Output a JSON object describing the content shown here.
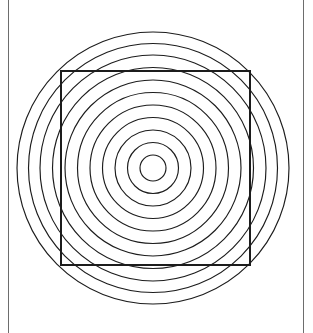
{
  "page": {
    "width": 313,
    "height": 333,
    "background_color": "#ffffff"
  },
  "borders": {
    "color": "#6d6d6d",
    "stroke_width": 1,
    "left_x": 8,
    "right_x": 303,
    "top_y": 0,
    "bottom_y": 333
  },
  "diagram": {
    "stroke_color": "#1c1c1c",
    "fill": "none",
    "center_x": 153,
    "center_y": 168,
    "circle_count": 11,
    "circle_stroke_width": 1.15,
    "radii": [
      13,
      25.5,
      38,
      50.5,
      63,
      75.5,
      88,
      100.5,
      113,
      124.5,
      136
    ],
    "square": {
      "x": 61,
      "y": 71,
      "width": 189,
      "height": 194,
      "stroke_width": 1.6
    }
  },
  "chart_data": {
    "type": "scatter",
    "xlabel": "",
    "ylabel": "",
    "center": [
      153,
      168
    ],
    "radii": [
      13,
      25.5,
      38,
      50.5,
      63,
      75.5,
      88,
      100.5,
      113,
      124.5,
      136
    ],
    "square_bounds": [
      61,
      71,
      250,
      265
    ],
    "grid": false,
    "legend": "none"
  }
}
